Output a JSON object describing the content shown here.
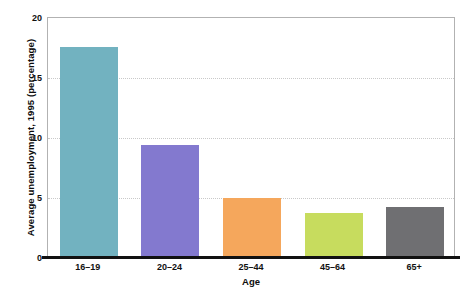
{
  "chart_data": {
    "type": "bar",
    "title": "",
    "xlabel": "Age",
    "ylabel": "Average unemployment, 1995 (percentage)",
    "categories": [
      "16–19",
      "20–24",
      "25–44",
      "45–64",
      "65+"
    ],
    "values": [
      17.5,
      9.3,
      4.9,
      3.7,
      4.2
    ],
    "bar_colors": [
      "#72b2c0",
      "#8379cf",
      "#f5a75c",
      "#c7dc5e",
      "#6f6f72"
    ],
    "ylim": [
      0,
      20
    ],
    "yticks": [
      0,
      5,
      10,
      15,
      20
    ],
    "ytick_labels": [
      "0",
      "5",
      "10",
      "15",
      "20"
    ],
    "grid": "horizontal dotted",
    "legend": "none"
  },
  "axis": {
    "y_title": "Average unemployment, 1995 (percentage)",
    "x_title": "Age"
  }
}
